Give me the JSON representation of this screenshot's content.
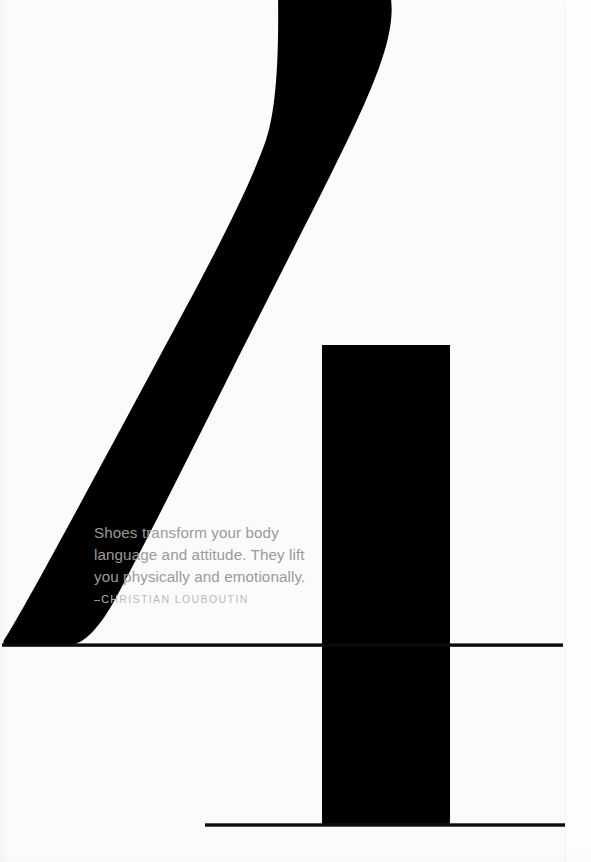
{
  "poster": {
    "title": "Shoes transform your body language and attitude poster",
    "background_color": "#fdfdfd",
    "ink_color": "#000000",
    "width": 591,
    "height": 862
  },
  "quote": {
    "text": "Shoes transform your body\nlanguage and attitude. They lift\nyou physically and emotionally.",
    "attribution": "–CHRISTIAN LOUBOUTIN",
    "text_color": "#9a9a9a",
    "attribution_color": "#b9b9b9"
  },
  "artwork": {
    "description": "silhouette of a stiletto high heel shoe rendered as an abstract black form",
    "elements": [
      {
        "name": "heel-spike",
        "description": "long tapering curved black spike from top-right to lower-left"
      },
      {
        "name": "heel-block",
        "description": "solid black vertical rectangle forming the platform column"
      },
      {
        "name": "ground-line-upper",
        "description": "thin horizontal rule at the base of the heel spike"
      },
      {
        "name": "ground-line-lower",
        "description": "thin horizontal rule at the base of the heel block"
      }
    ]
  },
  "shapes": {
    "heel_spike": {
      "path": "M 278 -4 C 316 -4 360 -4 390 -4 C 393 14 387 44 372 78 C 352 124 318 190 284 254 C 250 318 210 392 176 456 C 142 520 110 578 90 614 C 78 636 70 644 62 645 L 3 645 C 3 640 8 630 18 610 C 40 566 78 492 116 418 C 156 340 200 254 232 186 C 258 130 272 86 278 -4 Z"
    },
    "heel_block": {
      "x": 322,
      "y": 345,
      "width": 128,
      "height": 480
    },
    "ground_line_upper": {
      "x1": 2,
      "y1": 645,
      "x2": 563,
      "y2": 645,
      "thickness": 3.4
    },
    "ground_line_lower": {
      "x1": 205,
      "y1": 825,
      "x2": 565,
      "y2": 825,
      "thickness": 3.4
    }
  }
}
